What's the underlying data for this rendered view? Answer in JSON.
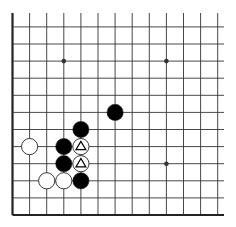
{
  "board": {
    "size": 19,
    "visible_region": "lower-left corner",
    "visible_columns": 13,
    "visible_rows": 12,
    "colors": {
      "background": "#ffffff",
      "grid_line": "#333333",
      "edge_line": "#222222",
      "black_stone": "#000000",
      "white_stone": "#ffffff",
      "stone_outline": "#222222",
      "marker": "#000000"
    },
    "star_points": [
      {
        "col": 4,
        "row": 4
      },
      {
        "col": 4,
        "row": 10
      },
      {
        "col": 10,
        "row": 4
      },
      {
        "col": 10,
        "row": 10
      }
    ],
    "stones": [
      {
        "color": "black",
        "col": 7,
        "row": 7,
        "mark": ""
      },
      {
        "color": "black",
        "col": 5,
        "row": 6,
        "mark": ""
      },
      {
        "color": "white",
        "col": 2,
        "row": 5,
        "mark": ""
      },
      {
        "color": "black",
        "col": 4,
        "row": 5,
        "mark": ""
      },
      {
        "color": "white",
        "col": 5,
        "row": 5,
        "mark": "triangle"
      },
      {
        "color": "black",
        "col": 4,
        "row": 4,
        "mark": ""
      },
      {
        "color": "white",
        "col": 5,
        "row": 4,
        "mark": "triangle"
      },
      {
        "color": "white",
        "col": 3,
        "row": 3,
        "mark": ""
      },
      {
        "color": "white",
        "col": 4,
        "row": 3,
        "mark": ""
      },
      {
        "color": "black",
        "col": 5,
        "row": 3,
        "mark": ""
      }
    ]
  }
}
